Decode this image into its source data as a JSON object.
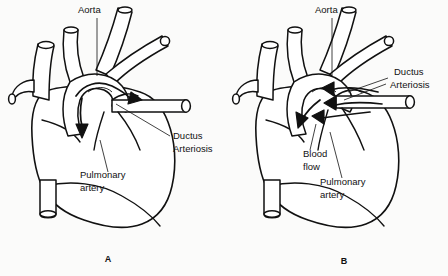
{
  "figure": {
    "background_color": "#fbfbfa",
    "ink_color": "#111111",
    "panels": [
      {
        "caption": "A",
        "caption_x": 108,
        "caption_y": 262,
        "labels": [
          {
            "name": "aorta",
            "text": "Aorta",
            "x": 78,
            "y": 13
          },
          {
            "name": "ductus-arteriosis-line1",
            "text": "Ductus",
            "x": 173,
            "y": 139
          },
          {
            "name": "ductus-arteriosis-line2",
            "text": "Arteriosis",
            "x": 173,
            "y": 152
          },
          {
            "name": "pulmonary-artery-line1",
            "text": "Pulmonary",
            "x": 80,
            "y": 178
          },
          {
            "name": "pulmonary-artery-line2",
            "text": "artery",
            "x": 80,
            "y": 191
          }
        ]
      },
      {
        "caption": "B",
        "caption_x": 344,
        "caption_y": 264,
        "labels": [
          {
            "name": "aorta",
            "text": "Aorta",
            "x": 315,
            "y": 13
          },
          {
            "name": "ductus-arteriosis-line1",
            "text": "Ductus",
            "x": 394,
            "y": 75
          },
          {
            "name": "ductus-arteriosis-line2",
            "text": "Arteriosis",
            "x": 390,
            "y": 88
          },
          {
            "name": "blood-flow-line1",
            "text": "Blood",
            "x": 303,
            "y": 157
          },
          {
            "name": "blood-flow-line2",
            "text": "flow",
            "x": 303,
            "y": 170
          },
          {
            "name": "pulmonary-artery-line1",
            "text": "Pulmonary",
            "x": 320,
            "y": 185
          },
          {
            "name": "pulmonary-artery-line2",
            "text": "artery",
            "x": 320,
            "y": 198
          }
        ]
      }
    ]
  }
}
